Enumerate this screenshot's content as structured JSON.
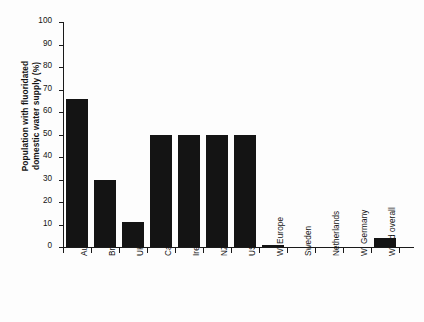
{
  "chart_data": {
    "type": "bar",
    "title": "",
    "subtitle": "",
    "xlabel": "",
    "ylabel": "Population with fluoridated domestic water supply (%)",
    "ylabel_lines": [
      "Population with fluoridated",
      "domestic water supply (%)"
    ],
    "ylim": [
      0,
      100
    ],
    "ytick_labels": [
      "0",
      "10",
      "20",
      "30",
      "40",
      "50",
      "60",
      "70",
      "80",
      "90",
      "100"
    ],
    "ytick_values": [
      0,
      10,
      20,
      30,
      40,
      50,
      60,
      70,
      80,
      90,
      100
    ],
    "grid": false,
    "legend": false,
    "legend_position": "none",
    "bar_color": "#141414",
    "axis_color": "#1a1a1a",
    "background_color": "#fdfdfd",
    "categories": [
      "Australia",
      "Brazil",
      "UK",
      "Canada",
      "Ireland",
      "NZ",
      "USA",
      "W. Europe",
      "Sweden",
      "Netherlands",
      "W. Germany",
      "World overall"
    ],
    "values": [
      66,
      30,
      11,
      50,
      50,
      50,
      50,
      1,
      0,
      0,
      0,
      4
    ],
    "series": [
      {
        "name": "Population with fluoridated domestic water supply (%)",
        "values": [
          66,
          30,
          11,
          50,
          50,
          50,
          50,
          1,
          0,
          0,
          0,
          4
        ]
      }
    ]
  }
}
